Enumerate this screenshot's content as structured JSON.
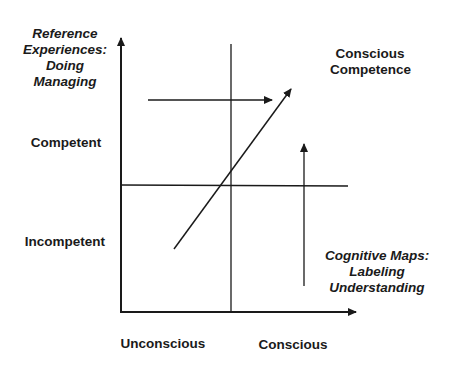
{
  "diagram": {
    "title": "Conscious Competence",
    "y_axis": {
      "top_label": [
        "Reference",
        "Experiences:",
        "Doing",
        "Managing"
      ],
      "levels": [
        "Competent",
        "Incompetent"
      ]
    },
    "x_axis": {
      "levels": [
        "Unconscious",
        "Conscious"
      ],
      "right_label": [
        "Cognitive Maps:",
        "Labeling",
        "Understanding"
      ]
    },
    "quadrant_title": [
      "Conscious",
      "Competence"
    ],
    "arrows": [
      {
        "name": "horizontal-arrow",
        "direction": "right"
      },
      {
        "name": "diagonal-arrow",
        "direction": "up-right"
      },
      {
        "name": "vertical-arrow",
        "direction": "up"
      }
    ],
    "colors": {
      "line": "#1a1a1a",
      "background": "#ffffff"
    }
  }
}
